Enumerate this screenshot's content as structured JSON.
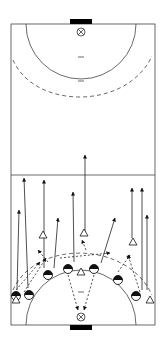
{
  "diagram": {
    "type": "handball-court-drill",
    "colors": {
      "line": "#444444",
      "background": "#ffffff",
      "goal": "#000000",
      "player": "#000000"
    },
    "court": {
      "x": 11,
      "y": 24,
      "width": 144,
      "height": 301,
      "center_line_y": 175
    },
    "goals": [
      {
        "id": "top-goal",
        "x": 70,
        "y": 19,
        "width": 22,
        "height": 5
      },
      {
        "id": "bottom-goal",
        "x": 70,
        "y": 325,
        "width": 22,
        "height": 5
      }
    ],
    "goal_markers": [
      {
        "id": "top-goal-marker",
        "cx": 81,
        "cy": 32
      },
      {
        "id": "bottom-goal-marker",
        "cx": 81,
        "cy": 317
      }
    ],
    "players_attack": [
      {
        "cx": 16,
        "cy": 296
      },
      {
        "cx": 29,
        "cy": 295
      },
      {
        "cx": 48,
        "cy": 275
      },
      {
        "cx": 68,
        "cy": 269
      },
      {
        "cx": 94,
        "cy": 269
      },
      {
        "cx": 118,
        "cy": 280
      },
      {
        "cx": 136,
        "cy": 296
      }
    ],
    "players_defense": [
      {
        "cx": 16,
        "cy": 300
      },
      {
        "cx": 43,
        "cy": 235
      },
      {
        "cx": 84,
        "cy": 233
      },
      {
        "cx": 81,
        "cy": 272
      },
      {
        "cx": 133,
        "cy": 242
      },
      {
        "cx": 150,
        "cy": 300
      }
    ],
    "runs": [
      {
        "x1": 17,
        "y1": 290,
        "x2": 19,
        "y2": 210
      },
      {
        "x1": 28,
        "y1": 288,
        "x2": 24,
        "y2": 178
      },
      {
        "x1": 44,
        "y1": 268,
        "x2": 44,
        "y2": 180
      },
      {
        "x1": 54,
        "y1": 268,
        "x2": 58,
        "y2": 218
      },
      {
        "x1": 74,
        "y1": 262,
        "x2": 73,
        "y2": 192
      },
      {
        "x1": 85,
        "y1": 233,
        "x2": 85,
        "y2": 155
      },
      {
        "x1": 101,
        "y1": 263,
        "x2": 115,
        "y2": 218
      },
      {
        "x1": 132,
        "y1": 238,
        "x2": 132,
        "y2": 188
      },
      {
        "x1": 142,
        "y1": 290,
        "x2": 142,
        "y2": 188
      },
      {
        "x1": 147,
        "y1": 290,
        "x2": 147,
        "y2": 215
      }
    ],
    "passes": [
      {
        "x1": 68,
        "y1": 275,
        "x2": 78,
        "y2": 310
      },
      {
        "x1": 94,
        "y1": 275,
        "x2": 84,
        "y2": 310
      },
      {
        "x1": 16,
        "y1": 290,
        "x2": 40,
        "y2": 262
      },
      {
        "x1": 24,
        "y1": 292,
        "x2": 46,
        "y2": 258
      },
      {
        "x1": 48,
        "y1": 262,
        "x2": 38,
        "y2": 250
      },
      {
        "x1": 118,
        "y1": 272,
        "x2": 130,
        "y2": 255
      },
      {
        "x1": 140,
        "y1": 292,
        "x2": 128,
        "y2": 255
      },
      {
        "x1": 60,
        "y1": 258,
        "x2": 110,
        "y2": 253
      },
      {
        "x1": 86,
        "y1": 250,
        "x2": 82,
        "y2": 240
      }
    ]
  }
}
